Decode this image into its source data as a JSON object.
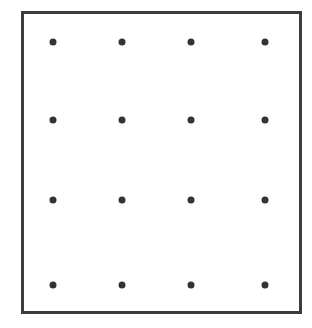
{
  "diagram": {
    "type": "dot-grid",
    "rows": 4,
    "columns": 4,
    "frame_color": "#3c3c3c",
    "dot_color": "#333333",
    "column_positions_px": [
      53,
      122,
      191,
      265
    ],
    "row_positions_px": [
      42,
      120,
      200,
      285
    ]
  }
}
